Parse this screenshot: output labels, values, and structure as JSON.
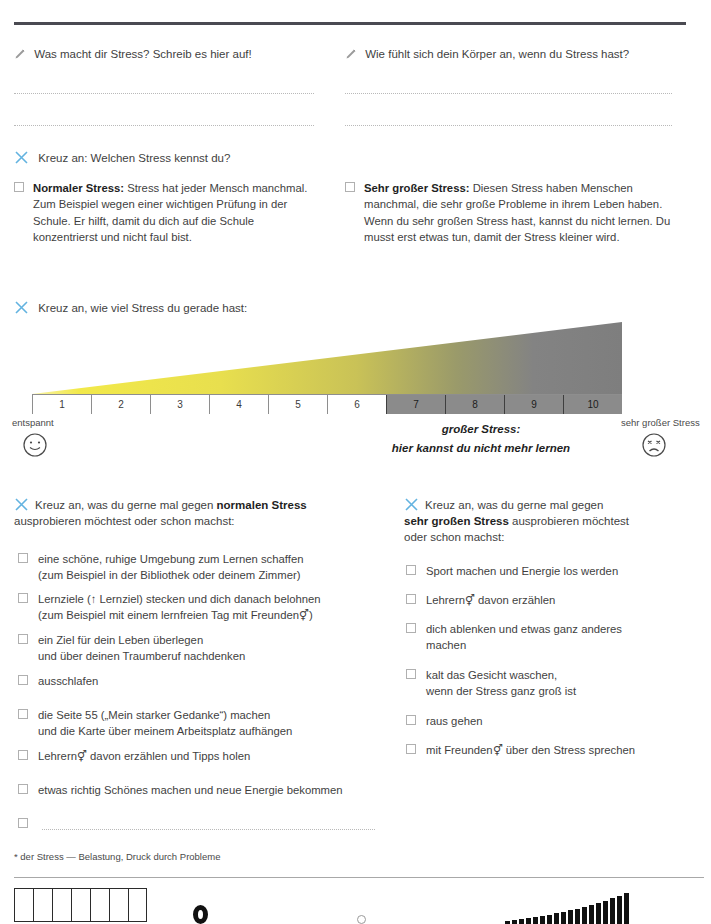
{
  "page": {
    "top_clip_text": "",
    "footnote": "* der Stress — Belastung, Druck durch Probleme"
  },
  "write_prompts": [
    {
      "icon": "pencil-icon",
      "text": "Was macht dir Stress? Schreib es hier auf!"
    },
    {
      "icon": "pencil-icon",
      "text": "Wie fühlt sich dein Körper an, wenn du Stress hast?"
    }
  ],
  "stress_types": {
    "heading": "Kreuz an: Welchen Stress kennst du?",
    "heading_icon": "x-mark-icon",
    "items": [
      {
        "title": "Normaler Stress:",
        "body": "Stress hat jeder Mensch manchmal. Zum Beispiel wegen einer wichtigen Prüfung in der Schule. Er hilft, damit du dich auf die Schule konzentrierst und nicht faul bist."
      },
      {
        "title": "Sehr großer Stress:",
        "body": "Diesen Stress haben Menschen manchmal, die sehr große Probleme in ihrem Leben haben. Wenn du sehr großen Stress hast, kannst du nicht lernen. Du musst erst etwas tun, damit der Stress kleiner wird."
      }
    ]
  },
  "scale": {
    "heading": "Kreuz an, wie viel Stress du gerade hast:",
    "heading_icon": "x-mark-icon",
    "ticks": [
      "1",
      "2",
      "3",
      "4",
      "5",
      "6",
      "7",
      "8",
      "9",
      "10"
    ],
    "gray_from_tick": 7,
    "left_label": "entspannt",
    "right_label": "sehr großer Stress",
    "left_face": "smiley-face-icon",
    "right_face": "sad-face-icon",
    "caption_line1": "großer Stress:",
    "caption_line2": "hier kannst du nicht mehr lernen",
    "gradient_start": "#f2e94a",
    "gradient_mid": "#b7b05a",
    "gradient_end": "#7e7e7e",
    "axis_fill": "#8b8b8b"
  },
  "normal_list": {
    "heading_icon": "x-mark-icon",
    "heading_pre": "Kreuz an, was du gerne mal gegen ",
    "heading_bold": "normalen Stress",
    "heading_post": "ausprobieren möchtest oder schon machst:",
    "items": [
      {
        "lines": [
          "eine schöne, ruhige Umgebung zum Lernen schaffen",
          "(zum Beispiel in der Bibliothek oder deinem Zimmer)"
        ]
      },
      {
        "lines": [
          "Lernziele (↑ Lernziel) stecken und dich danach belohnen",
          "(zum Beispiel mit einem lernfreien Tag mit Freunden⚥)"
        ],
        "underline_first_word": "Lernziele",
        "italic_ref": "Lernziel"
      },
      {
        "lines": [
          "ein Ziel für dein Leben überlegen",
          "und über deinen Traumberuf nachdenken"
        ]
      },
      {
        "lines": [
          "ausschlafen"
        ]
      },
      {
        "lines": [
          "die Seite 55 („Mein starker Gedanke“) machen",
          "und die Karte über meinem Arbeitsplatz aufhängen"
        ]
      },
      {
        "lines": [
          "Lehrern⚥ davon erzählen und Tipps holen"
        ]
      },
      {
        "lines": [
          "etwas richtig Schönes machen und neue Energie bekommen"
        ]
      },
      {
        "lines": [
          ""
        ],
        "blank_line": true
      }
    ]
  },
  "severe_list": {
    "heading_icon": "x-mark-icon",
    "heading_line1": "Kreuz an, was du gerne mal gegen",
    "heading_bold": "sehr großen Stress",
    "heading_line2_post": " ausprobieren möchtest",
    "heading_line3": "oder schon machst:",
    "items": [
      {
        "lines": [
          "Sport machen und Energie los werden"
        ]
      },
      {
        "lines": [
          "Lehrern⚥ davon erzählen"
        ]
      },
      {
        "lines": [
          "dich ablenken und etwas ganz anderes",
          "machen"
        ]
      },
      {
        "lines": [
          "kalt das Gesicht waschen,",
          "wenn der Stress ganz groß ist"
        ]
      },
      {
        "lines": [
          "raus gehen"
        ]
      },
      {
        "lines": [
          "mit Freunden⚥ über den Stress sprechen"
        ]
      }
    ]
  },
  "footer": {
    "grid_cells": 7,
    "bars": [
      3,
      4,
      5,
      6,
      7,
      8,
      9,
      11,
      12,
      14,
      15,
      17,
      19,
      21,
      23,
      26,
      28,
      31
    ]
  }
}
